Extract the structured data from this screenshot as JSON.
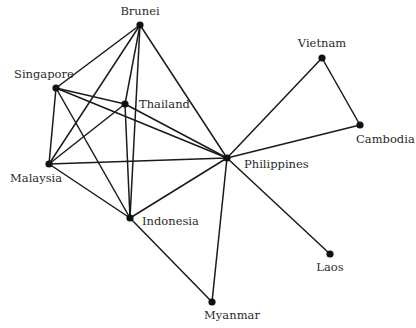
{
  "diagram": {
    "type": "network-graph",
    "nodes": [
      {
        "id": "brunei",
        "label": "Brunei",
        "x": 140,
        "y": 25,
        "lx": 140,
        "ly": 15,
        "anchor": "middle"
      },
      {
        "id": "singapore",
        "label": "Singapore",
        "x": 56,
        "y": 88,
        "lx": 14,
        "ly": 78,
        "anchor": "start"
      },
      {
        "id": "thailand",
        "label": "Thailand",
        "x": 125,
        "y": 104,
        "lx": 139,
        "ly": 108,
        "anchor": "start"
      },
      {
        "id": "malaysia",
        "label": "Malaysia",
        "x": 49,
        "y": 164,
        "lx": 10,
        "ly": 182,
        "anchor": "start"
      },
      {
        "id": "indonesia",
        "label": "Indonesia",
        "x": 130,
        "y": 218,
        "lx": 142,
        "ly": 225,
        "anchor": "start"
      },
      {
        "id": "philippines",
        "label": "Philippines",
        "x": 227,
        "y": 158,
        "lx": 244,
        "ly": 168,
        "anchor": "start"
      },
      {
        "id": "vietnam",
        "label": "Vietnam",
        "x": 322,
        "y": 58,
        "lx": 322,
        "ly": 47,
        "anchor": "middle"
      },
      {
        "id": "cambodia",
        "label": "Cambodia",
        "x": 360,
        "y": 125,
        "lx": 356,
        "ly": 143,
        "anchor": "start"
      },
      {
        "id": "laos",
        "label": "Laos",
        "x": 330,
        "y": 254,
        "lx": 330,
        "ly": 271,
        "anchor": "middle"
      },
      {
        "id": "myanmar",
        "label": "Myanmar",
        "x": 212,
        "y": 302,
        "lx": 232,
        "ly": 319,
        "anchor": "middle"
      }
    ],
    "edges": [
      [
        "brunei",
        "singapore"
      ],
      [
        "brunei",
        "malaysia"
      ],
      [
        "brunei",
        "thailand"
      ],
      [
        "brunei",
        "indonesia"
      ],
      [
        "brunei",
        "philippines"
      ],
      [
        "singapore",
        "thailand"
      ],
      [
        "singapore",
        "philippines"
      ],
      [
        "singapore",
        "malaysia"
      ],
      [
        "singapore",
        "indonesia"
      ],
      [
        "thailand",
        "malaysia"
      ],
      [
        "thailand",
        "indonesia"
      ],
      [
        "thailand",
        "philippines"
      ],
      [
        "malaysia",
        "philippines"
      ],
      [
        "malaysia",
        "indonesia"
      ],
      [
        "indonesia",
        "philippines"
      ],
      [
        "indonesia",
        "myanmar"
      ],
      [
        "philippines",
        "vietnam"
      ],
      [
        "philippines",
        "cambodia"
      ],
      [
        "philippines",
        "laos"
      ],
      [
        "philippines",
        "myanmar"
      ],
      [
        "vietnam",
        "cambodia"
      ]
    ],
    "colors": {
      "edge": "#1a1a1a",
      "node": "#111111",
      "label": "#2a2a2a",
      "background": "#ffffff"
    }
  }
}
